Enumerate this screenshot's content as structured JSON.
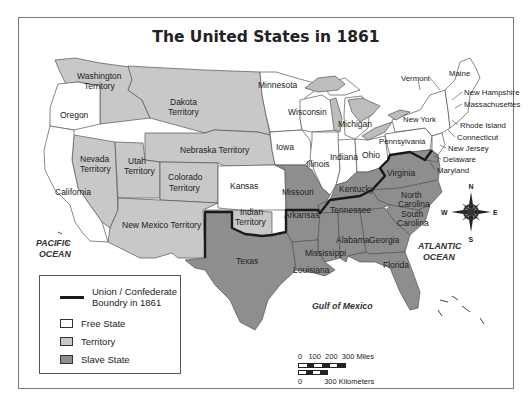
{
  "title": "The United States in 1861",
  "colors": {
    "free_state": "#ffffff",
    "territory": "#c8c8c8",
    "slave_state": "#8e8e8e",
    "lakes": "#bdbdbd",
    "boundary_line": "#1a1a1a",
    "state_border": "#555555"
  },
  "regions": {
    "territories": [
      "Washington Territory",
      "Dakota Territory",
      "Nebraska Territory",
      "Nevada Territory",
      "Utah Territory",
      "Colorado Territory",
      "New Mexico Territory",
      "Indian Territory"
    ],
    "free_states": [
      "Oregon",
      "California",
      "Minnesota",
      "Wisconsin",
      "Michigan",
      "Iowa",
      "Illinois",
      "Indiana",
      "Ohio",
      "Kansas",
      "Pennsylvania",
      "New York",
      "Vermont",
      "Maine",
      "New Hampshire",
      "Massachusettes",
      "Rhode Island",
      "Connecticut",
      "New Jersey"
    ],
    "slave_states": [
      "Missouri",
      "Kentucky",
      "Virginia",
      "Delaware",
      "Maryland",
      "North Carolina",
      "South Carolina",
      "Tennessee",
      "Arkansas",
      "Texas",
      "Louisiana",
      "Mississippi",
      "Alabama",
      "Georgia",
      "Florida"
    ]
  },
  "labels": {
    "washington": [
      "Washington",
      "Territory"
    ],
    "oregon": "Oregon",
    "dakota": [
      "Dakota",
      "Territory"
    ],
    "minnesota": "Minnesota",
    "wisconsin": "Wisconsin",
    "michigan": "Michigan",
    "nebraska": "Nebraska Territory",
    "iowa": "Iowa",
    "illinois": "Illinois",
    "indiana": "Indiana",
    "ohio": "Ohio",
    "nevada": [
      "Nevada",
      "Territory"
    ],
    "utah": [
      "Utah",
      "Territory"
    ],
    "colorado": [
      "Colorado",
      "Territory"
    ],
    "kansas": "Kansas",
    "california": "California",
    "missouri": "Missouri",
    "kentucky": "Kentucky",
    "virginia": "Virginia",
    "indian": [
      "Indian",
      "Territory"
    ],
    "new_mexico": "New Mexico Territory",
    "arkansas": "Arkansas",
    "tennessee": "Tennessee",
    "north_carolina": [
      "North",
      "Carolina"
    ],
    "south_carolina": [
      "South",
      "Carolina"
    ],
    "texas": "Texas",
    "mississippi": "Mississippi",
    "alabama": "Alabama",
    "georgia": "Georgia",
    "louisiana": "Louisiana",
    "florida": "Florida",
    "vermont": "Vermont",
    "maine": "Maine",
    "new_hampshire": "New Hampshire",
    "massachusettes": "Massachusettes",
    "new_york": "New York",
    "rhode_island": "Rhode Island",
    "connecticut": "Connecticut",
    "pennsylvania": "Pennsylvania",
    "new_jersey": "New Jersey",
    "delaware": "Delaware",
    "maryland": "Maryland"
  },
  "oceans": {
    "pacific": [
      "PACIFIC",
      "OCEAN"
    ],
    "atlantic": [
      "ATLANTIC",
      "OCEAN"
    ],
    "gulf": "Gulf of Mexico"
  },
  "compass": {
    "n": "N",
    "s": "S",
    "e": "E",
    "w": "W"
  },
  "legend": {
    "boundary": [
      "Union / Confederate",
      "Boundry in 1861"
    ],
    "free_state": "Free State",
    "territory": "Territory",
    "slave_state": "Slave State"
  },
  "scale": {
    "miles": "0   100  200  300 Miles",
    "km_zero": "0",
    "km": "300 Kilometers"
  }
}
